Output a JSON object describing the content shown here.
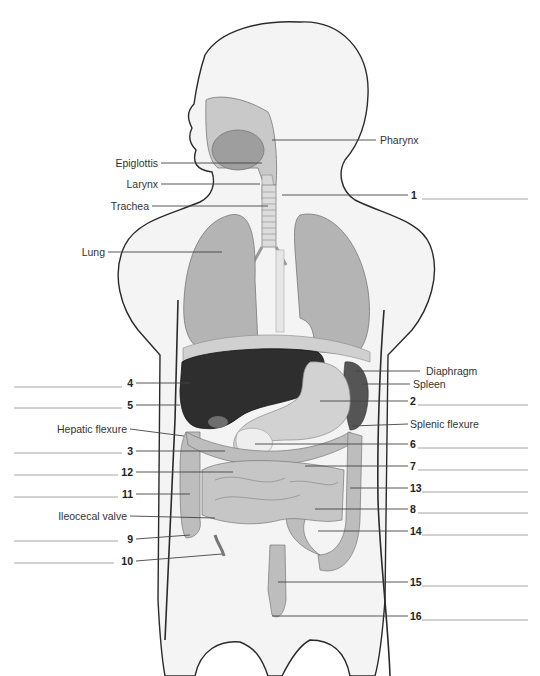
{
  "figure": {
    "type": "anatomical-diagram",
    "colors": {
      "skin_fill": "#f4f4f4",
      "outline": "#2a2a2a",
      "organ_light": "#c8c8c8",
      "organ_mid": "#a9a9a9",
      "liver": "#2e2e2e",
      "spleen": "#555555",
      "leader_line": "#444444",
      "blank_line": "#999999"
    }
  },
  "named_labels": [
    {
      "id": "pharynx",
      "text": "Pharynx",
      "side": "right"
    },
    {
      "id": "epiglottis",
      "text": "Epiglottis",
      "side": "left"
    },
    {
      "id": "larynx",
      "text": "Larynx",
      "side": "left"
    },
    {
      "id": "trachea",
      "text": "Trachea",
      "side": "left"
    },
    {
      "id": "lung",
      "text": "Lung",
      "side": "left"
    },
    {
      "id": "diaphragm",
      "text": "Diaphragm",
      "side": "right"
    },
    {
      "id": "spleen",
      "text": "Spleen",
      "side": "right"
    },
    {
      "id": "hepatic-flexure",
      "text": "Hepatic flexure",
      "side": "left"
    },
    {
      "id": "splenic-flexure",
      "text": "Splenic flexure",
      "side": "right"
    },
    {
      "id": "ileocecal-valve",
      "text": "Ileocecal valve",
      "side": "left"
    }
  ],
  "numbered_blanks": [
    {
      "number": "1",
      "side": "right",
      "answer": ""
    },
    {
      "number": "2",
      "side": "right",
      "answer": ""
    },
    {
      "number": "3",
      "side": "left",
      "answer": ""
    },
    {
      "number": "4",
      "side": "left",
      "answer": ""
    },
    {
      "number": "5",
      "side": "left",
      "answer": ""
    },
    {
      "number": "6",
      "side": "right",
      "answer": ""
    },
    {
      "number": "7",
      "side": "right",
      "answer": ""
    },
    {
      "number": "8",
      "side": "right",
      "answer": ""
    },
    {
      "number": "9",
      "side": "left",
      "answer": ""
    },
    {
      "number": "10",
      "side": "left",
      "answer": ""
    },
    {
      "number": "11",
      "side": "left",
      "answer": ""
    },
    {
      "number": "12",
      "side": "left",
      "answer": ""
    },
    {
      "number": "13",
      "side": "right",
      "answer": ""
    },
    {
      "number": "14",
      "side": "right",
      "answer": ""
    },
    {
      "number": "15",
      "side": "right",
      "answer": ""
    },
    {
      "number": "16",
      "side": "right",
      "answer": ""
    }
  ]
}
